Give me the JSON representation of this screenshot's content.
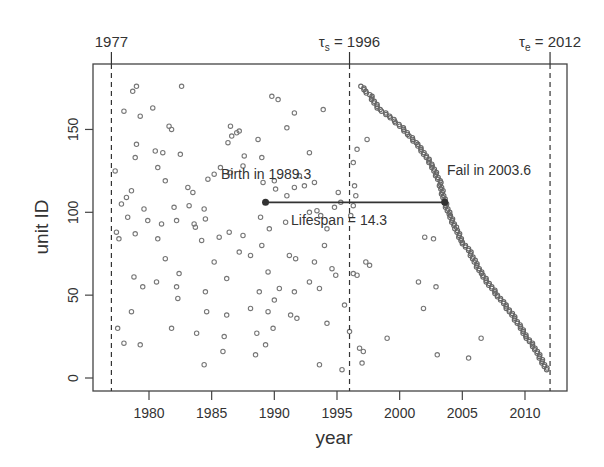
{
  "chart_data": {
    "type": "scatter",
    "title": "",
    "xlabel": "year",
    "ylabel": "unit ID",
    "xlim": [
      1975.5,
      2013.4
    ],
    "ylim": [
      -7,
      190
    ],
    "x_ticks": [
      1980,
      1985,
      1990,
      1995,
      2000,
      2005,
      2010
    ],
    "y_ticks": [
      0,
      50,
      100,
      150
    ],
    "grid": false,
    "legend": null,
    "reference_lines": [
      {
        "x": 1977,
        "label": "1977",
        "style": "dashed"
      },
      {
        "x": 1996,
        "label": "τs = 1996",
        "label_main": "τ",
        "label_sub": "s",
        "label_rest": " = 1996",
        "style": "dashed"
      },
      {
        "x": 2012,
        "label": "τe = 2012",
        "label_main": "τ",
        "label_sub": "e",
        "label_rest": " = 2012",
        "style": "dashed"
      }
    ],
    "highlight": {
      "unit_id": 106,
      "birth_year": 1989.3,
      "fail_year": 2003.6,
      "lifespan": 14.3
    },
    "annotations": [
      {
        "text": "Birth in 1989.3",
        "x": 1989.3,
        "y": 122
      },
      {
        "text": "Fail in 2003.6",
        "x": 2007.5,
        "y": 125
      },
      {
        "text": "Lifespan = 14.3",
        "x": 1996.4,
        "y": 96
      }
    ],
    "series": [
      {
        "name": "birth times (scattered)",
        "points": [
          [
            1979.0,
            176
          ],
          [
            1978.7,
            173
          ],
          [
            1982.6,
            176
          ],
          [
            1980.3,
            163
          ],
          [
            1978.0,
            161
          ],
          [
            1979.3,
            158
          ],
          [
            1981.6,
            152
          ],
          [
            1981.8,
            150
          ],
          [
            1986.5,
            152
          ],
          [
            1987.2,
            149
          ],
          [
            1979.0,
            141
          ],
          [
            1980.5,
            137
          ],
          [
            1981.1,
            136
          ],
          [
            1982.5,
            135
          ],
          [
            1978.9,
            133
          ],
          [
            1986.6,
            146
          ],
          [
            1987.0,
            148
          ],
          [
            1978.6,
            113
          ],
          [
            1980.7,
            127
          ],
          [
            1981.3,
            119
          ],
          [
            1983.1,
            115
          ],
          [
            1984.7,
            120
          ],
          [
            1985.2,
            123
          ],
          [
            1985.7,
            127
          ],
          [
            1977.3,
            125
          ],
          [
            1977.8,
            105
          ],
          [
            1979.6,
            102
          ],
          [
            1978.3,
            97
          ],
          [
            1982.0,
            103
          ],
          [
            1983.2,
            104
          ],
          [
            1981.0,
            93
          ],
          [
            1983.7,
            91
          ],
          [
            1985.6,
            85
          ],
          [
            1989.0,
            80
          ],
          [
            1986.4,
            88
          ],
          [
            1987.5,
            86
          ],
          [
            1977.4,
            88
          ],
          [
            1977.6,
            84
          ],
          [
            1981.3,
            72
          ],
          [
            1982.4,
            63
          ],
          [
            1978.8,
            61
          ],
          [
            1980.6,
            58
          ],
          [
            1979.5,
            55
          ],
          [
            1982.2,
            55
          ],
          [
            1984.5,
            52
          ],
          [
            1988.8,
            52
          ],
          [
            1982.3,
            48
          ],
          [
            1988.1,
            42
          ],
          [
            1981.8,
            30
          ],
          [
            1978.0,
            21
          ],
          [
            1979.3,
            20
          ],
          [
            1989.3,
            20
          ],
          [
            1983.8,
            27
          ],
          [
            1986.0,
            25
          ],
          [
            1988.6,
            27
          ],
          [
            1989.5,
            40
          ],
          [
            1990.0,
            47
          ],
          [
            1990.4,
            54
          ],
          [
            1991.6,
            52
          ],
          [
            1989.5,
            64
          ],
          [
            1988.1,
            74
          ],
          [
            1987.2,
            76
          ],
          [
            1984.2,
            83
          ],
          [
            1983.6,
            93
          ],
          [
            1982.2,
            95
          ],
          [
            1979.9,
            95
          ],
          [
            1978.2,
            109
          ],
          [
            1990.1,
            114
          ],
          [
            1991.6,
            115
          ],
          [
            1992.4,
            116
          ],
          [
            1993.2,
            118
          ],
          [
            1989.0,
            133
          ],
          [
            1987.6,
            134
          ],
          [
            1986.3,
            142
          ],
          [
            1991.0,
            151
          ],
          [
            1992.8,
            136
          ],
          [
            1989.8,
            170
          ],
          [
            1990.3,
            168
          ],
          [
            1993.9,
            162
          ],
          [
            1991.6,
            160
          ],
          [
            1988.7,
            144
          ],
          [
            1987.5,
            128
          ],
          [
            1986.5,
            124
          ],
          [
            1989.1,
            118
          ],
          [
            1990.0,
            119
          ],
          [
            1992.0,
            122
          ],
          [
            1995.1,
            112
          ],
          [
            1995.3,
            106
          ],
          [
            1994.8,
            103
          ],
          [
            1993.4,
            101
          ],
          [
            1992.8,
            100
          ],
          [
            1991.0,
            110
          ],
          [
            1989.6,
            90
          ],
          [
            1990.9,
            94
          ],
          [
            1993.7,
            98
          ],
          [
            1994.2,
            90
          ],
          [
            1988.9,
            97
          ],
          [
            1991.2,
            74
          ],
          [
            1991.7,
            72
          ],
          [
            1994.0,
            80
          ],
          [
            1993.2,
            70
          ],
          [
            1994.6,
            66
          ],
          [
            1996.3,
            63
          ],
          [
            1996.6,
            62
          ],
          [
            1997.3,
            70
          ],
          [
            1997.6,
            68
          ],
          [
            1992.8,
            58
          ],
          [
            1993.6,
            54
          ],
          [
            1991.3,
            38
          ],
          [
            1991.8,
            36
          ],
          [
            1994.9,
            62
          ],
          [
            1996.0,
            28
          ],
          [
            1996.8,
            18
          ],
          [
            1997.1,
            16
          ],
          [
            1995.4,
            5
          ],
          [
            1993.6,
            8
          ],
          [
            1985.9,
            16
          ],
          [
            1986.2,
            38
          ],
          [
            1984.6,
            40
          ],
          [
            1986.2,
            60
          ],
          [
            1984.5,
            96
          ],
          [
            1984.4,
            102
          ],
          [
            1983.5,
            112
          ],
          [
            1980.7,
            84
          ],
          [
            1996.1,
            98
          ],
          [
            1996.3,
            104
          ],
          [
            1996.5,
            110
          ],
          [
            1996.3,
            130
          ],
          [
            1996.6,
            138
          ],
          [
            1996.4,
            116
          ],
          [
            2001.9,
            42
          ],
          [
            2002.9,
            55
          ],
          [
            2001.5,
            58
          ],
          [
            2002.7,
            84
          ],
          [
            2002.0,
            85
          ],
          [
            2006.5,
            24
          ],
          [
            2005.5,
            12
          ],
          [
            2003.0,
            14
          ],
          [
            1997.0,
            9
          ],
          [
            1999.0,
            24
          ],
          [
            1997.4,
            144
          ],
          [
            1978.9,
            87
          ],
          [
            1984.4,
            8
          ],
          [
            1988.5,
            14
          ],
          [
            1994.2,
            33
          ],
          [
            1995.6,
            44
          ],
          [
            1985.2,
            70
          ],
          [
            1989.9,
            30
          ],
          [
            1978.6,
            40
          ],
          [
            1977.5,
            30
          ]
        ]
      },
      {
        "name": "failure times (ordered)",
        "points": [
          [
            1997.0,
            176
          ],
          [
            1997.3,
            173
          ],
          [
            1997.7,
            170
          ],
          [
            1998.0,
            166
          ],
          [
            1998.4,
            162
          ],
          [
            1999.0,
            159
          ],
          [
            1999.6,
            155
          ],
          [
            2000.2,
            151
          ],
          [
            2000.8,
            146
          ],
          [
            2001.4,
            141
          ],
          [
            2002.0,
            135
          ],
          [
            2002.6,
            128
          ],
          [
            2003.2,
            118
          ],
          [
            2003.6,
            106
          ],
          [
            2004.0,
            98
          ],
          [
            2004.5,
            90
          ],
          [
            2005.0,
            82
          ],
          [
            2005.6,
            76
          ],
          [
            2006.0,
            70
          ],
          [
            2006.6,
            62
          ],
          [
            2007.2,
            56
          ],
          [
            2007.8,
            50
          ],
          [
            2008.4,
            44
          ],
          [
            2009.0,
            38
          ],
          [
            2009.6,
            31
          ],
          [
            2010.2,
            24
          ],
          [
            2010.8,
            18
          ],
          [
            2011.3,
            11
          ],
          [
            2011.8,
            4
          ]
        ]
      }
    ]
  }
}
